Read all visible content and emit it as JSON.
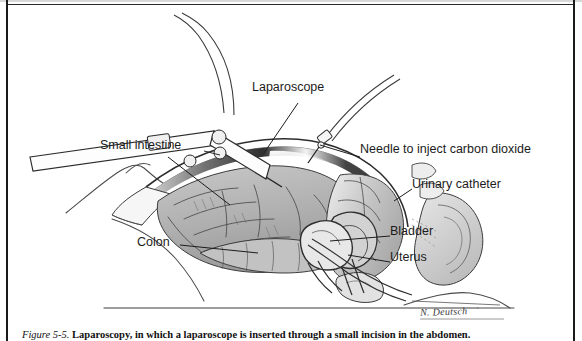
{
  "figure": {
    "caption_number": "Figure 5-5.",
    "caption_text": "Laparoscopy, in which a laparoscope is inserted through a small incision in the abdomen.",
    "artist_signature": "N. Deutsch"
  },
  "labels": {
    "laparoscope": "Laparoscope",
    "small_intestine": "Small intestine",
    "needle": "Needle to inject carbon dioxide",
    "urinary_catheter": "Urinary catheter",
    "colon": "Colon",
    "bladder": "Bladder",
    "uterus": "Uterus"
  },
  "colors": {
    "ink": "#1c1c1c",
    "paper": "#ffffff",
    "organ_fill_light": "#d9d9d9",
    "organ_fill_mid": "#b9b9b9",
    "organ_fill_dark": "#8f8f8f",
    "cavity_shadow": "#2b2b2b",
    "frame": "#1a1a1a"
  },
  "diagram": {
    "type": "medical-illustration",
    "view": "sagittal cutaway of female lower abdomen and pelvis",
    "instruments": [
      {
        "name": "laparoscope",
        "entry": "upper-left abdominal incision",
        "has_fiber_optic_cable": true
      },
      {
        "name": "insufflation-needle",
        "entry": "upper-right abdominal wall",
        "purpose": "inject carbon dioxide"
      },
      {
        "name": "urinary-catheter",
        "entry": "urethra into bladder"
      }
    ],
    "structures": [
      "small intestine",
      "colon",
      "bladder",
      "uterus",
      "abdominal wall",
      "pelvic bone",
      "spine"
    ]
  }
}
